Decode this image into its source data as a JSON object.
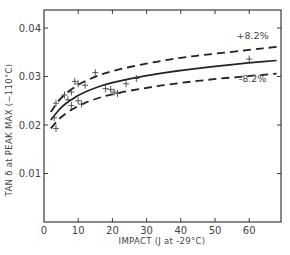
{
  "chart_data": {
    "type": "scatter",
    "title": "",
    "xlabel": "IMPACT (J at -29°C)",
    "ylabel": "TAN δ at PEAK MAX (−110°C)",
    "xlim": [
      0,
      69
    ],
    "ylim": [
      0,
      0.046
    ],
    "x_ticks": [
      0,
      10,
      20,
      30,
      40,
      50,
      60
    ],
    "x_tick_labels": [
      "0",
      "10",
      "20",
      "30",
      "40",
      "50",
      "60"
    ],
    "y_ticks": [
      0.01,
      0.02,
      0.03,
      0.04
    ],
    "y_tick_labels": [
      "0.01",
      "0.02",
      "0.03",
      "0.04"
    ],
    "grid": false,
    "legend": null,
    "series": [
      {
        "name": "measured",
        "kind": "scatter",
        "marker": "+",
        "points": [
          [
            3.5,
            0.0193
          ],
          [
            3.0,
            0.0215
          ],
          [
            3.5,
            0.0245
          ],
          [
            6.0,
            0.0262
          ],
          [
            7.0,
            0.0252
          ],
          [
            8.0,
            0.024
          ],
          [
            8.0,
            0.0268
          ],
          [
            9.0,
            0.029
          ],
          [
            10.0,
            0.0285
          ],
          [
            10.0,
            0.025
          ],
          [
            11.0,
            0.0243
          ],
          [
            12.0,
            0.0282
          ],
          [
            15.0,
            0.0308
          ],
          [
            18.0,
            0.0275
          ],
          [
            19.5,
            0.0273
          ],
          [
            20.5,
            0.0268
          ],
          [
            21.5,
            0.0265
          ],
          [
            24.0,
            0.0285
          ],
          [
            27.0,
            0.0296
          ],
          [
            60.0,
            0.0336
          ]
        ]
      },
      {
        "name": "fit",
        "kind": "line",
        "style": "solid",
        "x": [
          2,
          5,
          10,
          15,
          20,
          30,
          40,
          50,
          60,
          68
        ],
        "values": [
          0.021,
          0.0238,
          0.0262,
          0.0277,
          0.0288,
          0.0302,
          0.0313,
          0.0321,
          0.0328,
          0.0333
        ]
      },
      {
        "name": "+8.2%",
        "kind": "line",
        "style": "dashed",
        "x": [
          2,
          5,
          10,
          15,
          20,
          30,
          40,
          50,
          60,
          68
        ],
        "values": [
          0.0227,
          0.0258,
          0.0284,
          0.03,
          0.0312,
          0.0327,
          0.0339,
          0.0347,
          0.0355,
          0.0361
        ]
      },
      {
        "name": "-8.2%",
        "kind": "line",
        "style": "dashed",
        "x": [
          2,
          5,
          10,
          15,
          20,
          30,
          40,
          50,
          60,
          68
        ],
        "values": [
          0.0193,
          0.0218,
          0.024,
          0.0254,
          0.0264,
          0.0277,
          0.0287,
          0.0295,
          0.0301,
          0.0306
        ]
      }
    ],
    "annotations": [
      {
        "text": "+8.2%",
        "x": 61,
        "y": 0.0378
      },
      {
        "text": "-8.2%",
        "x": 61,
        "y": 0.0288
      }
    ]
  }
}
